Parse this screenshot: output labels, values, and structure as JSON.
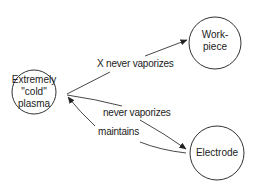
{
  "nodes": {
    "plasma": {
      "lines": [
        "Extremely",
        "\"cold\"",
        "plasma"
      ]
    },
    "workpiece": {
      "lines": [
        "Work-",
        "piece"
      ]
    },
    "electrode": {
      "lines": [
        "Electrode"
      ]
    }
  },
  "edges": {
    "plasma_to_workpiece": {
      "label": "X never vaporizes"
    },
    "plasma_to_electrode": {
      "label": "never vaporizes"
    },
    "electrode_to_plasma": {
      "label": "maintains"
    }
  },
  "colors": {
    "stroke": "#333333",
    "text": "#222222",
    "background": "#ffffff"
  }
}
